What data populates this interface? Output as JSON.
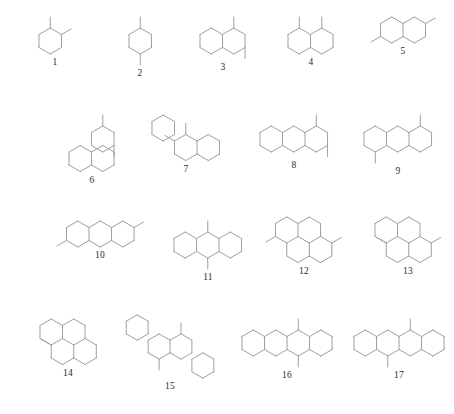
{
  "figure": {
    "kind": "chemical-structure-plate",
    "background_color": "#ffffff",
    "bond_color": "#9aa0a8",
    "label_color": "#2b2b2b",
    "total_structures": 17,
    "rows": 4,
    "geometry": {
      "hex_radius": 13.0,
      "methyl_length": 11.0
    }
  },
  "structures": [
    {
      "label": "1",
      "name": "ortho-dimethyl monocycle",
      "x": 18,
      "y": 14,
      "w": 74,
      "h": 72,
      "rings": [
        [
          0,
          0
        ]
      ],
      "methyls": [
        {
          "ring": 0,
          "vertex": 0,
          "dir": 0
        },
        {
          "ring": 0,
          "vertex": 1,
          "dir": 1
        }
      ]
    },
    {
      "label": "2",
      "name": "para-dimethyl monocycle",
      "x": 103,
      "y": 14,
      "w": 74,
      "h": 72,
      "rings": [
        [
          0,
          0
        ]
      ],
      "methyls": [
        {
          "ring": 0,
          "vertex": 0,
          "dir": 0
        },
        {
          "ring": 0,
          "vertex": 3,
          "dir": 3
        }
      ]
    },
    {
      "label": "3",
      "name": "angular bicycle, peri dimethyl",
      "x": 180,
      "y": 14,
      "w": 86,
      "h": 72,
      "rings": [
        [
          0,
          0
        ],
        [
          1,
          0
        ]
      ],
      "methyls": [
        {
          "ring": 1,
          "vertex": 0,
          "dir": 0
        },
        {
          "ring": 1,
          "vertex": 2,
          "dir": 3
        }
      ]
    },
    {
      "label": "4",
      "name": "fused bicycle, 1,8-dimethyl",
      "x": 268,
      "y": 14,
      "w": 86,
      "h": 72,
      "rings": [
        [
          0,
          0
        ],
        [
          1,
          0
        ]
      ],
      "methyls": [
        {
          "ring": 0,
          "vertex": 0,
          "dir": 0
        },
        {
          "ring": 1,
          "vertex": 0,
          "dir": 0
        }
      ]
    },
    {
      "label": "5",
      "name": "fused bicycle, 2,6-dimethyl",
      "x": 358,
      "y": 14,
      "w": 90,
      "h": 72,
      "rings": [
        [
          0,
          0
        ],
        [
          1,
          0
        ]
      ],
      "methyls": [
        {
          "ring": 0,
          "vertex": 4,
          "dir": 4
        },
        {
          "ring": 1,
          "vertex": 1,
          "dir": 1
        }
      ]
    },
    {
      "label": "6",
      "name": "angular tricycle, dimethyl",
      "x": 46,
      "y": 112,
      "w": 92,
      "h": 76,
      "rings": [
        [
          0,
          1
        ],
        [
          1,
          1
        ],
        [
          1,
          0
        ]
      ],
      "methyls": [
        {
          "ring": 2,
          "vertex": 0,
          "dir": 0
        },
        {
          "ring": 2,
          "vertex": 2,
          "dir": 3
        }
      ]
    },
    {
      "label": "7",
      "name": "angular tricycle, adjacent dimethyl",
      "x": 140,
      "y": 112,
      "w": 92,
      "h": 76,
      "rings": [
        [
          0,
          0
        ],
        [
          1,
          1
        ],
        [
          2,
          1
        ]
      ],
      "methyls": [
        {
          "ring": 1,
          "vertex": 0,
          "dir": 0
        },
        {
          "ring": 1,
          "vertex": 5,
          "dir": 5
        }
      ]
    },
    {
      "label": "8",
      "name": "linear tricycle, peri dimethyl",
      "x": 244,
      "y": 112,
      "w": 100,
      "h": 76,
      "rings": [
        [
          0,
          0
        ],
        [
          1,
          0
        ],
        [
          2,
          0
        ]
      ],
      "methyls": [
        {
          "ring": 2,
          "vertex": 0,
          "dir": 0
        },
        {
          "ring": 2,
          "vertex": 2,
          "dir": 3
        }
      ]
    },
    {
      "label": "9",
      "name": "linear tricycle, anti dimethyl",
      "x": 348,
      "y": 112,
      "w": 100,
      "h": 76,
      "rings": [
        [
          0,
          0
        ],
        [
          1,
          0
        ],
        [
          2,
          0
        ]
      ],
      "methyls": [
        {
          "ring": 2,
          "vertex": 0,
          "dir": 0
        },
        {
          "ring": 0,
          "vertex": 3,
          "dir": 3
        }
      ]
    },
    {
      "label": "10",
      "name": "linear tricycle, terminal dimethyl",
      "x": 48,
      "y": 218,
      "w": 104,
      "h": 76,
      "rings": [
        [
          0,
          0
        ],
        [
          1,
          0
        ],
        [
          2,
          0
        ]
      ],
      "methyls": [
        {
          "ring": 0,
          "vertex": 4,
          "dir": 4
        },
        {
          "ring": 2,
          "vertex": 1,
          "dir": 1
        }
      ]
    },
    {
      "label": "11",
      "name": "linear tricycle, meso dimethyl",
      "x": 158,
      "y": 218,
      "w": 100,
      "h": 76,
      "rings": [
        [
          0,
          0
        ],
        [
          1,
          0
        ],
        [
          2,
          0
        ]
      ],
      "methyls": [
        {
          "ring": 1,
          "vertex": 0,
          "dir": 0
        },
        {
          "ring": 1,
          "vertex": 3,
          "dir": 3
        }
      ]
    },
    {
      "label": "12",
      "name": "peri-fused tetracycle, dimethyl",
      "x": 256,
      "y": 214,
      "w": 96,
      "h": 80,
      "rings": [
        [
          0,
          0
        ],
        [
          1,
          0
        ],
        [
          0.5,
          1
        ],
        [
          1.5,
          1
        ]
      ],
      "methyls": [
        {
          "ring": 3,
          "vertex": 1,
          "dir": 1
        },
        {
          "ring": 0,
          "vertex": 4,
          "dir": 4
        }
      ]
    },
    {
      "label": "13",
      "name": "peri-fused tetracycle, symmetric dimethyl",
      "x": 360,
      "y": 214,
      "w": 96,
      "h": 80,
      "rings": [
        [
          0,
          0
        ],
        [
          1,
          0
        ],
        [
          0.5,
          1
        ],
        [
          1.5,
          1
        ]
      ],
      "methyls": [
        {
          "ring": 2,
          "vertex": 5,
          "dir": 5
        },
        {
          "ring": 3,
          "vertex": 1,
          "dir": 1
        }
      ]
    },
    {
      "label": "14",
      "name": "peri-fused tetracycle, top dimethyl",
      "x": 20,
      "y": 316,
      "w": 96,
      "h": 80,
      "rings": [
        [
          0,
          0
        ],
        [
          1,
          0
        ],
        [
          0.5,
          1
        ],
        [
          1.5,
          1
        ]
      ],
      "methyls": [
        {
          "ring": 2,
          "vertex": 0,
          "dir": 0
        },
        {
          "ring": 2,
          "vertex": 5,
          "dir": 5
        }
      ]
    },
    {
      "label": "15",
      "name": "angular tetracycle, dimethyl",
      "x": 118,
      "y": 312,
      "w": 104,
      "h": 82,
      "rings": [
        [
          0,
          0
        ],
        [
          1,
          1
        ],
        [
          2,
          1
        ],
        [
          3,
          2
        ]
      ],
      "methyls": [
        {
          "ring": 2,
          "vertex": 0,
          "dir": 0
        },
        {
          "ring": 1,
          "vertex": 3,
          "dir": 3
        }
      ]
    },
    {
      "label": "16",
      "name": "linear tetracycle, meso dimethyl",
      "x": 232,
      "y": 316,
      "w": 110,
      "h": 78,
      "rings": [
        [
          0,
          0
        ],
        [
          1,
          0
        ],
        [
          2,
          0
        ],
        [
          3,
          0
        ]
      ],
      "methyls": [
        {
          "ring": 2,
          "vertex": 0,
          "dir": 0
        },
        {
          "ring": 2,
          "vertex": 3,
          "dir": 3
        }
      ]
    },
    {
      "label": "17",
      "name": "linear tetracycle, staggered dimethyl",
      "x": 344,
      "y": 316,
      "w": 110,
      "h": 78,
      "rings": [
        [
          0,
          0
        ],
        [
          1,
          0
        ],
        [
          2,
          0
        ],
        [
          3,
          0
        ]
      ],
      "methyls": [
        {
          "ring": 2,
          "vertex": 0,
          "dir": 0
        },
        {
          "ring": 1,
          "vertex": 3,
          "dir": 3
        }
      ]
    }
  ]
}
